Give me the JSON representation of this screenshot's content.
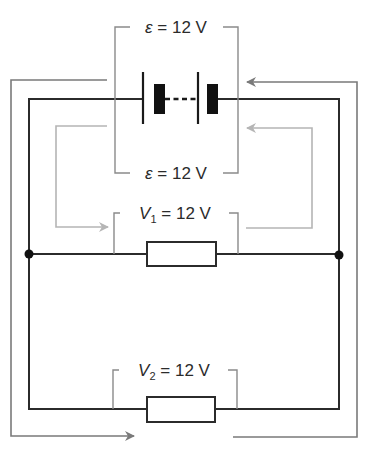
{
  "labels": {
    "emf_top": {
      "symbol": "ε",
      "equals": " = ",
      "value": "12 V"
    },
    "emf_bottom": {
      "symbol": "ε",
      "equals": " = ",
      "value": "12 V"
    },
    "v1": {
      "symbol": "V",
      "subscript": "1",
      "equals": " = ",
      "value": "12 V"
    },
    "v2": {
      "symbol": "V",
      "subscript": "2",
      "equals": " = ",
      "value": "12 V"
    }
  },
  "components": {
    "battery": {
      "cells": 2,
      "emf": "12 V"
    },
    "resistor_1": {
      "voltage": "12 V"
    },
    "resistor_2": {
      "voltage": "12 V"
    }
  },
  "colors": {
    "wire": "#2b2b2b",
    "outer_path": "#7a7a7a",
    "inner_path": "#b5b5b5",
    "bracket": "#8a8a8a",
    "label": "#2b2b2b"
  }
}
